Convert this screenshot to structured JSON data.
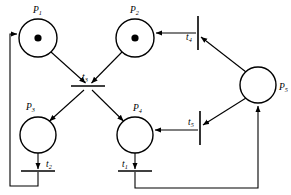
{
  "diagram": {
    "type": "petri-net",
    "background_color": "#ffffff",
    "stroke_color": "#000000"
  },
  "places": [
    {
      "id": "P1",
      "label": "P",
      "subscript": "1",
      "tokens": 1,
      "cx": 38,
      "cy": 38,
      "r": 19,
      "label_x": 33,
      "label_y": 13
    },
    {
      "id": "P2",
      "label": "P",
      "subscript": "2",
      "tokens": 1,
      "cx": 135,
      "cy": 38,
      "r": 19,
      "label_x": 130,
      "label_y": 13
    },
    {
      "id": "P3",
      "label": "P",
      "subscript": "3",
      "tokens": 0,
      "cx": 38,
      "cy": 135,
      "r": 18,
      "label_x": 26,
      "label_y": 110
    },
    {
      "id": "P4",
      "label": "P",
      "subscript": "4",
      "tokens": 0,
      "cx": 135,
      "cy": 135,
      "r": 18,
      "label_x": 133,
      "label_y": 111
    },
    {
      "id": "P5",
      "label": "P",
      "subscript": "5",
      "tokens": 0,
      "cx": 258,
      "cy": 85,
      "r": 18,
      "label_x": 279,
      "label_y": 90
    }
  ],
  "transitions": [
    {
      "id": "t1",
      "label": "t",
      "subscript": "1",
      "orientation": "horizontal",
      "x": 135,
      "y": 171,
      "half_len": 17,
      "label_x": 122,
      "label_y": 167
    },
    {
      "id": "t2",
      "label": "t",
      "subscript": "2",
      "orientation": "horizontal",
      "x": 38,
      "y": 171,
      "half_len": 17,
      "label_x": 46,
      "label_y": 167
    },
    {
      "id": "t3",
      "label": "t",
      "subscript": "3",
      "orientation": "horizontal",
      "x": 88,
      "y": 86,
      "half_len": 17,
      "label_x": 82,
      "label_y": 80
    },
    {
      "id": "t4",
      "label": "t",
      "subscript": "4",
      "orientation": "vertical",
      "x": 198,
      "y": 33,
      "half_len": 17,
      "label_x": 186,
      "label_y": 40
    },
    {
      "id": "t5",
      "label": "t",
      "subscript": "5",
      "orientation": "vertical",
      "x": 200,
      "y": 128,
      "half_len": 17,
      "label_x": 188,
      "label_y": 125
    }
  ],
  "arcs": [
    {
      "id": "arc-p1-t3",
      "from": "P1",
      "to": "t3",
      "kind": "place-to-transition"
    },
    {
      "id": "arc-p2-t3",
      "from": "P2",
      "to": "t3",
      "kind": "place-to-transition"
    },
    {
      "id": "arc-t3-p3",
      "from": "t3",
      "to": "P3",
      "kind": "transition-to-place"
    },
    {
      "id": "arc-t3-p4",
      "from": "t3",
      "to": "P4",
      "kind": "transition-to-place"
    },
    {
      "id": "arc-p3-t2",
      "from": "P3",
      "to": "t2",
      "kind": "place-to-transition"
    },
    {
      "id": "arc-t2-p1",
      "from": "t2",
      "to": "P1",
      "kind": "transition-to-place"
    },
    {
      "id": "arc-p4-t1",
      "from": "P4",
      "to": "t1",
      "kind": "place-to-transition"
    },
    {
      "id": "arc-t1-p5",
      "from": "t1",
      "to": "P5",
      "kind": "transition-to-place"
    },
    {
      "id": "arc-p5-t4",
      "from": "P5",
      "to": "t4",
      "kind": "place-to-transition"
    },
    {
      "id": "arc-t4-p2",
      "from": "t4",
      "to": "P2",
      "kind": "transition-to-place"
    },
    {
      "id": "arc-p5-t5",
      "from": "P5",
      "to": "t5",
      "kind": "place-to-transition"
    },
    {
      "id": "arc-t5-p4",
      "from": "t5",
      "to": "P4",
      "kind": "transition-to-place"
    }
  ]
}
